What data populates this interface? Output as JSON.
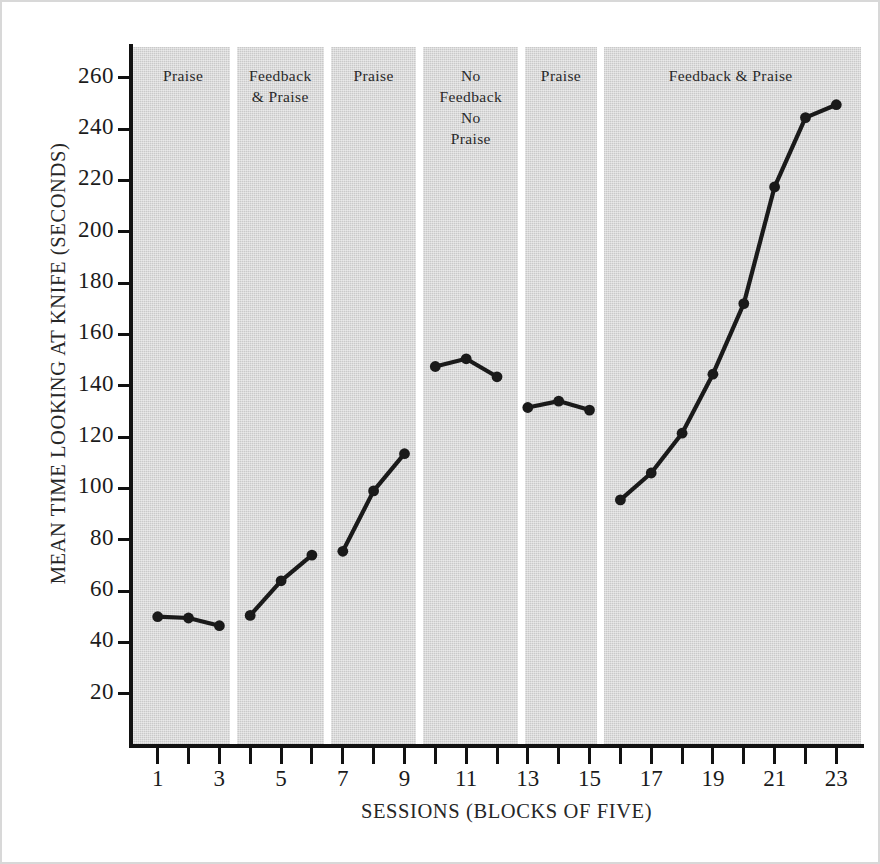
{
  "chart_data": {
    "type": "line",
    "title": "",
    "xlabel": "SESSIONS (BLOCKS OF FIVE)",
    "ylabel": "MEAN TIME LOOKING AT KNIFE (SECONDS)",
    "xlim": [
      0.2,
      23.8
    ],
    "ylim": [
      0,
      272
    ],
    "yticks": [
      20,
      40,
      60,
      80,
      100,
      120,
      140,
      160,
      180,
      200,
      220,
      240,
      260
    ],
    "ytick_labels": [
      "20",
      "40",
      "60",
      "80",
      "100",
      "120",
      "140",
      "160",
      "180",
      "200",
      "220",
      "240",
      "260"
    ],
    "xticks": [
      1,
      2,
      3,
      4,
      5,
      6,
      7,
      8,
      9,
      10,
      11,
      12,
      13,
      14,
      15,
      16,
      17,
      18,
      19,
      20,
      21,
      22,
      23
    ],
    "xtick_labels": [
      "1",
      "",
      "3",
      "",
      "5",
      "",
      "7",
      "",
      "9",
      "",
      "11",
      "",
      "13",
      "",
      "15",
      "",
      "17",
      "",
      "19",
      "",
      "21",
      "",
      "23"
    ],
    "grid": false,
    "legend": false,
    "marker": "filled-circle",
    "line_color": "#1a1a1a",
    "plot_background": "#c9c9c9",
    "x": [
      1,
      2,
      3,
      4,
      5,
      6,
      7,
      8,
      9,
      10,
      11,
      12,
      13,
      14,
      15,
      16,
      17,
      18,
      19,
      20,
      21,
      22,
      23
    ],
    "values": [
      50,
      49.5,
      46.5,
      50.5,
      64,
      74,
      75.5,
      99,
      113.5,
      147.5,
      150.5,
      143.5,
      131.5,
      134,
      130.5,
      95.5,
      106,
      121.5,
      144.5,
      172,
      217.5,
      244.5,
      249.5
    ],
    "series": [
      {
        "name": "Mean time looking at knife",
        "segments": [
          {
            "phase": "Praise",
            "x": [
              1,
              2,
              3
            ],
            "values": [
              50,
              49.5,
              46.5
            ]
          },
          {
            "phase": "Feedback & Praise",
            "x": [
              4,
              5,
              6
            ],
            "values": [
              50.5,
              64,
              74
            ]
          },
          {
            "phase": "Praise",
            "x": [
              7,
              8,
              9
            ],
            "values": [
              75.5,
              99,
              113.5
            ]
          },
          {
            "phase": "No Feedback No Praise",
            "x": [
              10,
              11,
              12
            ],
            "values": [
              147.5,
              150.5,
              143.5
            ]
          },
          {
            "phase": "Praise",
            "x": [
              13,
              14,
              15
            ],
            "values": [
              131.5,
              134,
              130.5
            ]
          },
          {
            "phase": "Feedback & Praise",
            "x": [
              16,
              17,
              18,
              19,
              20,
              21,
              22,
              23
            ],
            "values": [
              95.5,
              106,
              121.5,
              144.5,
              172,
              217.5,
              244.5,
              249.5
            ]
          }
        ]
      }
    ],
    "phases": [
      {
        "label": "Praise",
        "sessions": [
          1,
          3
        ],
        "x_start": 0.2,
        "x_end": 3.45
      },
      {
        "label": "Feedback\n& Praise",
        "sessions": [
          4,
          6
        ],
        "x_start": 3.45,
        "x_end": 6.5
      },
      {
        "label": "Praise",
        "sessions": [
          7,
          9
        ],
        "x_start": 6.5,
        "x_end": 9.5
      },
      {
        "label": "No\nFeedback\nNo\nPraise",
        "sessions": [
          10,
          12
        ],
        "x_start": 9.5,
        "x_end": 12.8
      },
      {
        "label": "Praise",
        "sessions": [
          13,
          15
        ],
        "x_start": 12.8,
        "x_end": 15.35
      },
      {
        "label": "Feedback & Praise",
        "sessions": [
          16,
          23
        ],
        "x_start": 15.35,
        "x_end": 23.8
      }
    ]
  },
  "figure": {
    "ylabel": "MEAN TIME LOOKING AT KNIFE (SECONDS)",
    "xlabel": "SESSIONS (BLOCKS OF FIVE)"
  }
}
